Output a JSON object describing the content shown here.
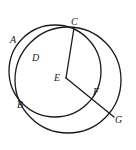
{
  "figure": {
    "name": "two-intersecting-circles-with-radii",
    "background_color": "#ffffff",
    "stroke_color": "#1a1a1a",
    "label_color": "#1a1a1a",
    "width": 136,
    "height": 150
  },
  "circles": [
    {
      "id": "large-circle",
      "cx": 68,
      "cy": 80,
      "r": 53,
      "stroke_width": 1.3
    },
    {
      "id": "small-circle",
      "cx": 55,
      "cy": 71,
      "r": 46,
      "stroke_width": 1.3
    }
  ],
  "segments": [
    {
      "id": "segment-CE",
      "from": "C",
      "to": "E",
      "x1": 74,
      "y1": 28,
      "x2": 66,
      "y2": 78,
      "stroke_width": 1.3
    },
    {
      "id": "segment-EG",
      "from": "E",
      "to": "G",
      "x1": 66,
      "y1": 78,
      "x2": 114,
      "y2": 117,
      "stroke_width": 1.3
    }
  ],
  "points": [
    {
      "id": "A",
      "label": "A",
      "label_x": 10,
      "label_y": 35
    },
    {
      "id": "C",
      "label": "C",
      "label_x": 71,
      "label_y": 17,
      "px": 74,
      "py": 28
    },
    {
      "id": "D",
      "label": "D",
      "label_x": 32,
      "label_y": 53
    },
    {
      "id": "E",
      "label": "E",
      "label_x": 54,
      "label_y": 73,
      "px": 66,
      "py": 78
    },
    {
      "id": "B",
      "label": "B",
      "label_x": 17,
      "label_y": 100,
      "px": 20,
      "py": 102
    },
    {
      "id": "F",
      "label": "F",
      "label_x": 93,
      "label_y": 87,
      "px": 92,
      "py": 93
    },
    {
      "id": "G",
      "label": "G",
      "label_x": 115,
      "label_y": 115,
      "px": 114,
      "py": 117
    }
  ]
}
